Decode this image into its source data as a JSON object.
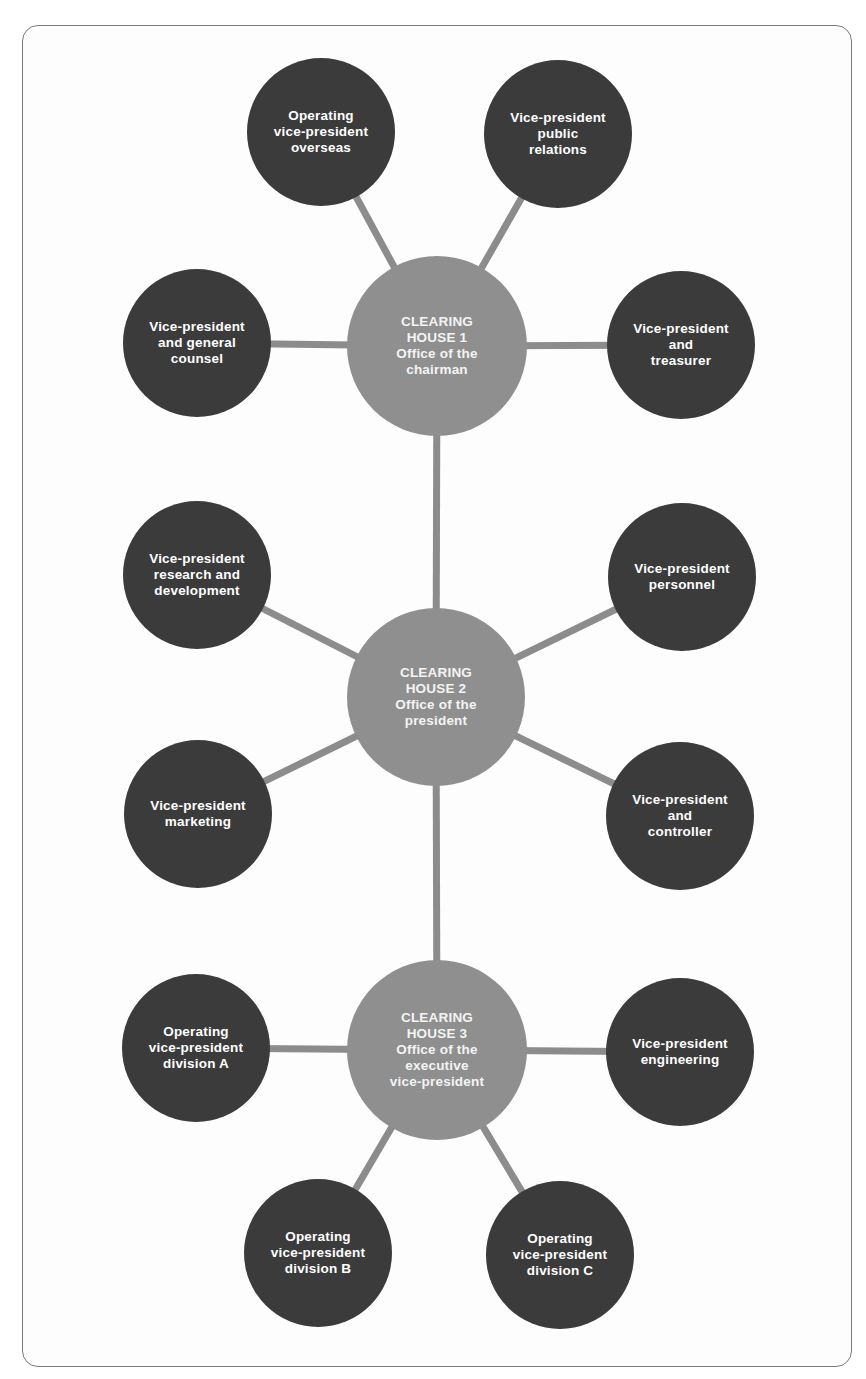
{
  "diagram": {
    "colors": {
      "hub_fill": "#8f8f8f",
      "satellite_fill": "#3b3b3b",
      "connector": "#8c8c8c",
      "text": "#ffffff",
      "frame_border": "#7a7a7a"
    },
    "hubs": [
      {
        "id": "ch1",
        "label": "CLEARING\nHOUSE 1\nOffice of the\nchairman",
        "cx": 437,
        "cy": 346,
        "r": 90
      },
      {
        "id": "ch2",
        "label": "CLEARING\nHOUSE 2\nOffice of the\npresident",
        "cx": 436,
        "cy": 697,
        "r": 89
      },
      {
        "id": "ch3",
        "label": "CLEARING\nHOUSE 3\nOffice of the\nexecutive\nvice-president",
        "cx": 437,
        "cy": 1050,
        "r": 90
      }
    ],
    "satellites": [
      {
        "id": "overseas",
        "hub": "ch1",
        "label": "Operating\nvice-president\noverseas",
        "cx": 321,
        "cy": 132,
        "r": 74
      },
      {
        "id": "public-relations",
        "hub": "ch1",
        "label": "Vice-president\npublic\nrelations",
        "cx": 558,
        "cy": 134,
        "r": 74
      },
      {
        "id": "general-counsel",
        "hub": "ch1",
        "label": "Vice-president\nand general\ncounsel",
        "cx": 197,
        "cy": 343,
        "r": 74
      },
      {
        "id": "treasurer",
        "hub": "ch1",
        "label": "Vice-president\nand\ntreasurer",
        "cx": 681,
        "cy": 345,
        "r": 74
      },
      {
        "id": "research-development",
        "hub": "ch2",
        "label": "Vice-president\nresearch and\ndevelopment",
        "cx": 197,
        "cy": 575,
        "r": 74
      },
      {
        "id": "personnel",
        "hub": "ch2",
        "label": "Vice-president\npersonnel",
        "cx": 682,
        "cy": 577,
        "r": 74
      },
      {
        "id": "marketing",
        "hub": "ch2",
        "label": "Vice-president\nmarketing",
        "cx": 198,
        "cy": 814,
        "r": 74
      },
      {
        "id": "controller",
        "hub": "ch2",
        "label": "Vice-president\nand\ncontroller",
        "cx": 680,
        "cy": 816,
        "r": 74
      },
      {
        "id": "division-a",
        "hub": "ch3",
        "label": "Operating\nvice-president\ndivision A",
        "cx": 196,
        "cy": 1048,
        "r": 74
      },
      {
        "id": "engineering",
        "hub": "ch3",
        "label": "Vice-president\nengineering",
        "cx": 680,
        "cy": 1052,
        "r": 74
      },
      {
        "id": "division-b",
        "hub": "ch3",
        "label": "Operating\nvice-president\ndivision B",
        "cx": 318,
        "cy": 1253,
        "r": 74
      },
      {
        "id": "division-c",
        "hub": "ch3",
        "label": "Operating\nvice-president\ndivision C",
        "cx": 560,
        "cy": 1255,
        "r": 74
      }
    ],
    "hub_links": [
      {
        "from": "ch1",
        "to": "ch2"
      },
      {
        "from": "ch2",
        "to": "ch3"
      }
    ]
  }
}
